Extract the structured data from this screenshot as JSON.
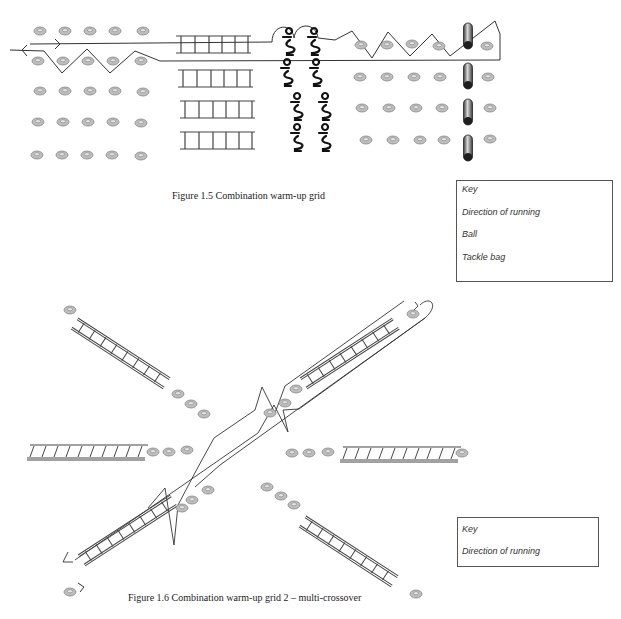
{
  "figure1": {
    "caption": "Figure 1.5 Combination warm-up grid",
    "key": {
      "title": "Key",
      "items": [
        {
          "label": "Direction of running",
          "symbol": "arrow"
        },
        {
          "label": "Ball",
          "symbol": "ball"
        },
        {
          "label": "Tackle bag",
          "symbol": "tackle-bag"
        }
      ]
    },
    "elements": {
      "ball_rows_left": 5,
      "balls_per_row_left": 5,
      "ladders": 4,
      "player_pairs": 4,
      "tackle_bags": 4,
      "ball_rows_right": 4,
      "balls_per_row_right": 5
    }
  },
  "figure2": {
    "caption": "Figure 1.6 Combination warm-up grid 2 – multi-crossover",
    "key": {
      "title": "Key",
      "items": [
        {
          "label": "Direction of running",
          "symbol": "arrow"
        }
      ]
    },
    "elements": {
      "ladders": 6,
      "balls_per_ladder_group": 3
    }
  },
  "colors": {
    "line": "#333333",
    "ball_fill": "#bdbdbd",
    "ball_stroke": "#888888",
    "bag_dark": "#2a2a2a",
    "bag_light": "#9a9a9a"
  }
}
